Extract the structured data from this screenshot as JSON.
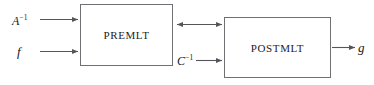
{
  "figure": {
    "background_color": "#ffffff",
    "line_color": "#55555a",
    "box_border_color": "#6f6f74",
    "text_color": "#18181a"
  },
  "blocks": [
    {
      "id": "premlt",
      "label": "PREMLT"
    },
    {
      "id": "postmlt",
      "label": "POSTMLT"
    }
  ],
  "signals": {
    "input_matrix": {
      "base": "A",
      "exponent": "−1",
      "text": "A⁻¹"
    },
    "input_function": {
      "base": "f",
      "exponent": "",
      "text": "f"
    },
    "intermediate": {
      "base": "C",
      "exponent": "−1",
      "text": "C⁻¹"
    },
    "output_function": {
      "base": "g",
      "exponent": "",
      "text": "g"
    }
  },
  "connections": [
    {
      "name": "a-inverse-to-premlt",
      "from": "A⁻¹",
      "to": "PREMLT",
      "direction": "forward"
    },
    {
      "name": "f-to-premlt",
      "from": "f",
      "to": "PREMLT",
      "direction": "forward"
    },
    {
      "name": "premlt-postmlt-link",
      "from": "PREMLT",
      "to": "POSTMLT",
      "direction": "bidirectional"
    },
    {
      "name": "c-inverse-to-postmlt",
      "from": "C⁻¹",
      "to": "POSTMLT",
      "direction": "forward"
    },
    {
      "name": "postmlt-to-g",
      "from": "POSTMLT",
      "to": "g",
      "direction": "forward"
    }
  ]
}
